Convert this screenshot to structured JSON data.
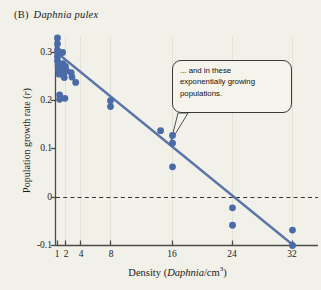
{
  "figure": {
    "panel_letter": "(B)",
    "species": "Daphnia pulex"
  },
  "annotation": {
    "text": "... and in these exponentially growing populations.",
    "line1": "... and in these",
    "line2": "exponentially growing",
    "line3": "populations."
  },
  "colors": {
    "point": "#4a6aa8",
    "line": "#5a74a8",
    "background": "#f1f0e9",
    "axis": "#4a4a46",
    "grid": "#e3e2d8",
    "zero_line": "#3a3a36",
    "callout_border": "#3a3a3a"
  },
  "chart_data": {
    "type": "scatter",
    "xlabel": "Density (Daphnia/cm3)",
    "ylabel": "Population growth rate (r)",
    "xlabel_parts": {
      "pre": "Density (",
      "italic": "Daphnia",
      "mid": "/cm",
      "sup": "3",
      "post": ")"
    },
    "ylabel_parts": {
      "pre": "Population growth rate (",
      "italic": "r",
      "post": ")"
    },
    "x_scale": "log-like (compressed low end)",
    "xticks": [
      1,
      2,
      4,
      8,
      16,
      24,
      32
    ],
    "xtick_labels": [
      "1",
      "2",
      "4",
      "8",
      "16",
      "24",
      "32"
    ],
    "yticks": [
      0.3,
      0.2,
      0.1,
      0,
      -0.1
    ],
    "ytick_labels": [
      "0.3",
      "0.2",
      "0.1",
      "0",
      "-0.1"
    ],
    "ylim": [
      -0.115,
      0.345
    ],
    "grid": "faint vertical gridlines at x ticks",
    "legend": "none",
    "zero_reference_line": {
      "y": 0,
      "style": "dashed"
    },
    "points": [
      {
        "x": 1,
        "y": 0.33
      },
      {
        "x": 1,
        "y": 0.318
      },
      {
        "x": 1,
        "y": 0.305
      },
      {
        "x": 1,
        "y": 0.3
      },
      {
        "x": 1,
        "y": 0.292
      },
      {
        "x": 1,
        "y": 0.283
      },
      {
        "x": 1.05,
        "y": 0.272
      },
      {
        "x": 1.1,
        "y": 0.262
      },
      {
        "x": 1.15,
        "y": 0.255
      },
      {
        "x": 1.2,
        "y": 0.212
      },
      {
        "x": 1.2,
        "y": 0.203
      },
      {
        "x": 1.55,
        "y": 0.3
      },
      {
        "x": 1.6,
        "y": 0.277
      },
      {
        "x": 1.7,
        "y": 0.264
      },
      {
        "x": 1.75,
        "y": 0.258
      },
      {
        "x": 1.8,
        "y": 0.248
      },
      {
        "x": 1.9,
        "y": 0.205
      },
      {
        "x": 2.0,
        "y": 0.271
      },
      {
        "x": 2.1,
        "y": 0.262
      },
      {
        "x": 2.6,
        "y": 0.258
      },
      {
        "x": 2.7,
        "y": 0.249
      },
      {
        "x": 3.2,
        "y": 0.238
      },
      {
        "x": 8.0,
        "y": 0.2
      },
      {
        "x": 8.0,
        "y": 0.188
      },
      {
        "x": 14.0,
        "y": 0.138
      },
      {
        "x": 16.0,
        "y": 0.128
      },
      {
        "x": 16.0,
        "y": 0.112
      },
      {
        "x": 16.0,
        "y": 0.063
      },
      {
        "x": 24.0,
        "y": -0.022
      },
      {
        "x": 24.0,
        "y": -0.058
      },
      {
        "x": 32.0,
        "y": -0.068
      },
      {
        "x": 32.0,
        "y": -0.1
      }
    ],
    "trend_line": {
      "type": "linear regression on transformed density axis",
      "start": {
        "x": 1,
        "y": 0.335
      },
      "end": {
        "x": 32,
        "y": -0.1
      }
    }
  }
}
